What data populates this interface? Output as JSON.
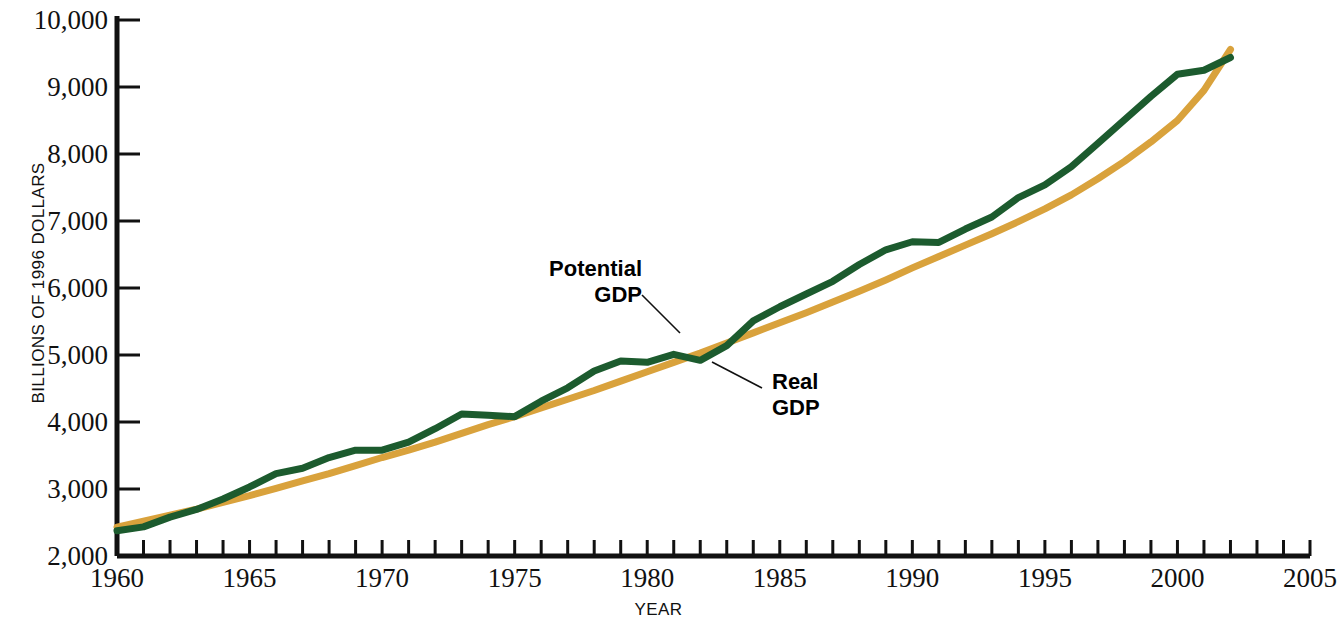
{
  "chart_data": {
    "type": "line",
    "title": "",
    "xlabel": "YEAR",
    "ylabel": "BILLIONS OF 1996 DOLLARS",
    "xlim": [
      1960,
      2005
    ],
    "ylim": [
      2000,
      10000
    ],
    "grid": false,
    "legend_position": "inline-annotations",
    "x_tick_labels": [
      "1960",
      "1965",
      "1970",
      "1975",
      "1980",
      "1985",
      "1990",
      "1995",
      "2000",
      "2005"
    ],
    "x_tick_values": [
      1960,
      1965,
      1970,
      1975,
      1980,
      1985,
      1990,
      1995,
      2000,
      2005
    ],
    "x_minor_tick_interval": 1,
    "y_tick_labels": [
      "2,000",
      "3,000",
      "4,000",
      "5,000",
      "6,000",
      "7,000",
      "8,000",
      "9,000",
      "10,000"
    ],
    "y_tick_values": [
      2000,
      3000,
      4000,
      5000,
      6000,
      7000,
      8000,
      9000,
      10000
    ],
    "x": [
      1960,
      1961,
      1962,
      1963,
      1964,
      1965,
      1966,
      1967,
      1968,
      1969,
      1970,
      1971,
      1972,
      1973,
      1974,
      1975,
      1976,
      1977,
      1978,
      1979,
      1980,
      1981,
      1982,
      1983,
      1984,
      1985,
      1986,
      1987,
      1988,
      1989,
      1990,
      1991,
      1992,
      1993,
      1994,
      1995,
      1996,
      1997,
      1998,
      1999,
      2000,
      2001,
      2002
    ],
    "series": [
      {
        "name": "Potential GDP",
        "color": "#D9A23C",
        "annotation": "Potential\nGDP",
        "values": [
          2430,
          2520,
          2610,
          2700,
          2800,
          2900,
          3010,
          3120,
          3230,
          3350,
          3470,
          3580,
          3700,
          3830,
          3960,
          4080,
          4210,
          4340,
          4470,
          4610,
          4750,
          4890,
          5030,
          5180,
          5330,
          5480,
          5630,
          5790,
          5950,
          6120,
          6300,
          6470,
          6640,
          6810,
          6990,
          7180,
          7390,
          7630,
          7890,
          8180,
          8500,
          8950,
          9560
        ]
      },
      {
        "name": "Real GDP",
        "color": "#1C5B2E",
        "annotation": "Real\nGDP",
        "values": [
          2377,
          2435,
          2580,
          2695,
          2850,
          3030,
          3230,
          3310,
          3470,
          3580,
          3580,
          3700,
          3900,
          4120,
          4100,
          4080,
          4310,
          4510,
          4760,
          4910,
          4890,
          5010,
          4920,
          5140,
          5510,
          5720,
          5910,
          6100,
          6350,
          6570,
          6690,
          6680,
          6880,
          7060,
          7350,
          7540,
          7810,
          8160,
          8510,
          8860,
          9190,
          9250,
          9440
        ]
      }
    ],
    "annotations": [
      {
        "label": "Potential GDP",
        "leader_from": [
          642,
          295
        ],
        "leader_to": [
          680,
          333
        ]
      },
      {
        "label": "Real GDP",
        "leader_from": [
          762,
          388
        ],
        "leader_to": [
          712,
          362
        ]
      }
    ]
  },
  "axis": {
    "y_title": "BILLIONS OF 1996 DOLLARS",
    "x_title": "YEAR"
  },
  "colors": {
    "potential_gdp": "#D9A23C",
    "real_gdp": "#1C5B2E",
    "axis": "#111111",
    "background": "#FFFFFF"
  }
}
